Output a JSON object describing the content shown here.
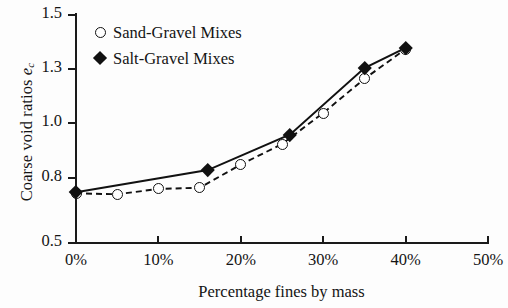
{
  "chart_data": {
    "type": "line",
    "title": "",
    "xlabel": "Percentage fines by mass",
    "ylabel": "Coarse void ratios e_c",
    "ylabel_main": "Coarse void ratios ",
    "ylabel_symbol": "e",
    "ylabel_subscript": "c",
    "xlim": [
      0,
      50
    ],
    "ylim": [
      0.5,
      1.5
    ],
    "grid": false,
    "legend_position": "upper-left-inside",
    "xtick_labels": [
      "0%",
      "10%",
      "20%",
      "30%",
      "40%",
      "50%"
    ],
    "xtick_values": [
      0,
      10,
      20,
      30,
      40,
      50
    ],
    "ytick_labels": [
      "1.5",
      "1.3",
      "1.0",
      "0.8",
      "0.5"
    ],
    "ytick_values": [
      1.5,
      1.3,
      1.0,
      0.8,
      0.5
    ],
    "series": [
      {
        "name": "Sand-Gravel Mixes",
        "marker": "open-circle",
        "line_style": "dashed",
        "color": "#111111",
        "x": [
          0,
          5,
          10,
          15,
          20,
          25,
          30,
          35,
          40
        ],
        "values": [
          0.725,
          0.72,
          0.745,
          0.75,
          0.845,
          0.92,
          1.05,
          1.24,
          1.37
        ]
      },
      {
        "name": "Salt-Gravel Mixes",
        "marker": "filled-diamond",
        "line_style": "solid",
        "color": "#111111",
        "x": [
          0,
          16,
          26,
          35,
          40
        ],
        "values": [
          0.73,
          0.825,
          0.955,
          1.3,
          1.375
        ]
      }
    ],
    "legend": [
      {
        "label": "Sand-Gravel Mixes",
        "marker": "open-circle"
      },
      {
        "label": "Salt-Gravel Mixes",
        "marker": "filled-diamond"
      }
    ]
  },
  "axes": {
    "x_title": "Percentage fines by mass",
    "y_title_text": "Coarse void ratios ",
    "y_title_symbol": "e",
    "y_title_sub": "c"
  },
  "legend": {
    "item0_label": "Sand-Gravel Mixes",
    "item1_label": "Salt-Gravel Mixes"
  },
  "ticks": {
    "y": [
      "1.5",
      "1.3",
      "1.0",
      "0.8",
      "0.5"
    ],
    "x": [
      "0%",
      "10%",
      "20%",
      "30%",
      "40%",
      "50%"
    ]
  }
}
